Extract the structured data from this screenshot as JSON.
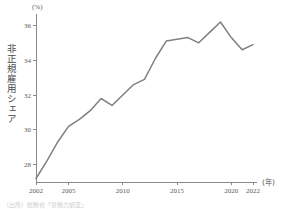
{
  "figure": {
    "y_axis_title": "非正規雇用シェア",
    "y_unit": "(%)",
    "x_unit": "(年)",
    "footnote": "（出所）総務省「労働力調査」"
  },
  "chart_data": {
    "type": "line",
    "title": "",
    "subtitle": "",
    "xlabel": "(年)",
    "ylabel": "非正規雇用シェア",
    "yunit": "(%)",
    "grid": false,
    "legend": false,
    "line_color": "#808080",
    "axis_color": "#8a8a8a",
    "xlim": [
      2002,
      2022
    ],
    "ylim": [
      27,
      36.6
    ],
    "xticks": [
      2002,
      2005,
      2010,
      2015,
      2020,
      2022
    ],
    "xtick_labels": [
      "2002",
      "2005",
      "2010",
      "2015",
      "2020",
      "2022"
    ],
    "yticks": [
      28,
      30,
      32,
      34,
      36
    ],
    "ytick_labels": [
      "28",
      "30",
      "32",
      "34",
      "36"
    ],
    "x": [
      2002,
      2003,
      2004,
      2005,
      2006,
      2007,
      2008,
      2009,
      2010,
      2011,
      2012,
      2013,
      2014,
      2015,
      2016,
      2017,
      2018,
      2019,
      2020,
      2021,
      2022
    ],
    "values": [
      27.2,
      28.2,
      29.3,
      30.2,
      30.6,
      31.1,
      31.8,
      31.4,
      32.0,
      32.6,
      32.9,
      34.1,
      35.1,
      35.2,
      35.3,
      35.0,
      35.6,
      36.2,
      35.3,
      34.6,
      34.9
    ],
    "series": [
      {
        "name": "非正規雇用シェア",
        "values": [
          27.2,
          28.2,
          29.3,
          30.2,
          30.6,
          31.1,
          31.8,
          31.4,
          32.0,
          32.6,
          32.9,
          34.1,
          35.1,
          35.2,
          35.3,
          35.0,
          35.6,
          36.2,
          35.3,
          34.6,
          34.9
        ]
      }
    ]
  }
}
